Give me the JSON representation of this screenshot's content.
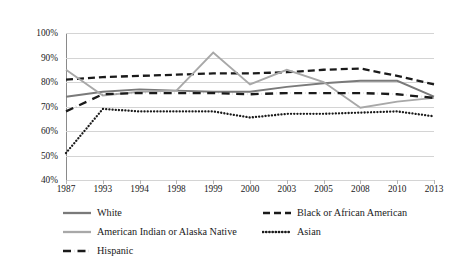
{
  "chart_data": {
    "type": "line",
    "title": "",
    "xlabel": "",
    "ylabel": "",
    "categories": [
      "1987",
      "1993",
      "1994",
      "1998",
      "1999",
      "2000",
      "2003",
      "2005",
      "2008",
      "2010",
      "2013"
    ],
    "ylim": [
      40,
      100
    ],
    "ytick_labels": [
      "100%",
      "90%",
      "80%",
      "70%",
      "60%",
      "50%",
      "40%"
    ],
    "ytick_values": [
      100,
      90,
      80,
      70,
      60,
      50,
      40
    ],
    "grid": true,
    "legend_position": "bottom",
    "series": [
      {
        "name": "White",
        "style": "solid",
        "color": "#7a7a7a",
        "values": [
          74,
          76,
          77,
          76.5,
          76,
          76,
          78,
          79.5,
          80.5,
          80.5,
          74
        ]
      },
      {
        "name": "Black or African American",
        "style": "dashed",
        "color": "#1a1a1a",
        "values": [
          81,
          82,
          82.5,
          83,
          83.5,
          83.5,
          84,
          85,
          85.5,
          82.5,
          79
        ]
      },
      {
        "name": "American Indian or Alaska Native",
        "style": "solid",
        "color": "#a8a8a8",
        "values": [
          85,
          74.5,
          76,
          76.5,
          92,
          79,
          85,
          80,
          69.5,
          72,
          73.5
        ]
      },
      {
        "name": "Asian",
        "style": "dotted",
        "color": "#1a1a1a",
        "values": [
          51,
          69,
          68,
          68,
          68,
          65.5,
          67,
          67,
          67.5,
          68,
          66
        ]
      },
      {
        "name": "Hispanic",
        "style": "dashdot",
        "color": "#1a1a1a",
        "values": [
          68,
          75,
          75.5,
          75.5,
          75.5,
          75,
          75.5,
          75.5,
          75.5,
          75,
          73.5
        ]
      }
    ]
  },
  "legend": {
    "entries": [
      {
        "label": "White",
        "swatch": "line-solid-dark-gray"
      },
      {
        "label": "Black or African American",
        "swatch": "line-dashed-black"
      },
      {
        "label": "American Indian or Alaska Native",
        "swatch": "line-solid-light-gray"
      },
      {
        "label": "Asian",
        "swatch": "line-dotted-black"
      },
      {
        "label": "Hispanic",
        "swatch": "line-dashdot-black"
      }
    ]
  },
  "colors": {
    "white_series": "#7a7a7a",
    "black_series": "#1a1a1a",
    "aian_series": "#a8a8a8",
    "asian_series": "#1a1a1a",
    "hispanic_series": "#1a1a1a",
    "gridline": "#d4d4d4",
    "axis": "#8a8a8a",
    "background": "#ffffff"
  }
}
